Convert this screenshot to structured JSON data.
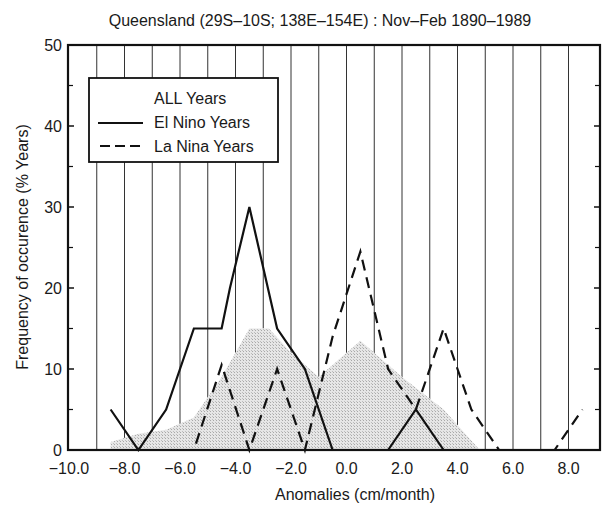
{
  "chart_data": {
    "type": "line",
    "title": "Queensland (29S–10S; 138E–154E) : Nov–Feb 1890–1989",
    "xlabel": "Anomalies (cm/month)",
    "ylabel": "Frequency of occurence (% Years)",
    "xlim": [
      -10.0,
      9.0
    ],
    "ylim": [
      0,
      50
    ],
    "x_ticks": [
      -10.0,
      -8.0,
      -6.0,
      -4.0,
      -2.0,
      0.0,
      2.0,
      4.0,
      6.0,
      8.0
    ],
    "x_tick_labels": [
      "−10.0",
      "−8.0",
      "−6.0",
      "−4.0",
      "−2.0",
      "0.0",
      "2.0",
      "4.0",
      "6.0",
      "8.0"
    ],
    "y_ticks": [
      0,
      10,
      20,
      30,
      40,
      50
    ],
    "y_tick_labels": [
      "0",
      "10",
      "20",
      "30",
      "40",
      "50"
    ],
    "grid": {
      "vertical": true,
      "horizontal": false,
      "x_step": 1.0
    },
    "legend": {
      "position": "upper-left",
      "entries": [
        {
          "label": "ALL Years",
          "style": "shaded"
        },
        {
          "label": "El Nino Years",
          "style": "solid"
        },
        {
          "label": "La Nina Years",
          "style": "dashed"
        }
      ]
    },
    "series": [
      {
        "name": "ALL Years",
        "style": "shaded",
        "color": "#d6d6d6",
        "x": [
          -8.5,
          -7.5,
          -6.5,
          -5.5,
          -4.5,
          -3.5,
          -2.8,
          -2.0,
          -1.0,
          0.5,
          2.0,
          3.5,
          4.8
        ],
        "y": [
          1,
          2,
          2.5,
          4,
          9,
          15,
          15,
          12,
          9,
          13.5,
          9,
          5,
          0
        ]
      },
      {
        "name": "El Nino Years",
        "style": "solid",
        "color": "#111111",
        "x": [
          -8.5,
          -7.5,
          -6.5,
          -5.5,
          -4.5,
          -4.2,
          -3.5,
          -2.5,
          -1.5,
          -0.5,
          0.5,
          1.5,
          2.5,
          3.5,
          4.5,
          5.5,
          6.5,
          7.5,
          8.5
        ],
        "y": [
          5,
          0,
          5,
          15,
          15,
          20,
          30,
          15,
          10,
          0,
          0,
          0,
          5,
          0,
          0,
          0,
          0,
          0,
          0
        ]
      },
      {
        "name": "La Nina Years",
        "style": "dashed",
        "color": "#111111",
        "x": [
          -8.5,
          -7.5,
          -6.5,
          -5.5,
          -4.5,
          -3.5,
          -2.5,
          -1.5,
          -0.5,
          0.5,
          1.5,
          2.5,
          3.5,
          4.5,
          5.5,
          6.5,
          7.5,
          8.5
        ],
        "y": [
          0,
          0,
          0,
          0,
          10.5,
          0,
          10,
          0,
          14,
          24.5,
          10,
          5,
          15,
          5,
          0,
          0,
          0,
          5
        ]
      }
    ]
  }
}
